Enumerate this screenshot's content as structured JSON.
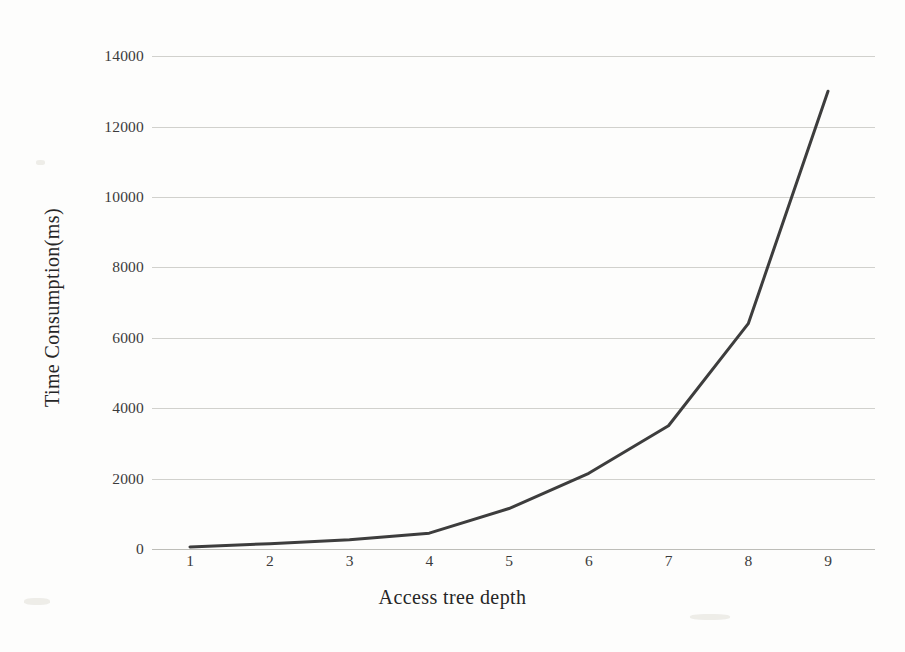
{
  "chart_data": {
    "type": "line",
    "title": "",
    "xlabel": "Access tree depth",
    "ylabel": "Time Consumption(ms)",
    "x": [
      1,
      2,
      3,
      4,
      5,
      6,
      7,
      8,
      9
    ],
    "categories": [
      "1",
      "2",
      "3",
      "4",
      "5",
      "6",
      "7",
      "8",
      "9"
    ],
    "values": [
      60,
      150,
      260,
      450,
      1150,
      2150,
      3500,
      6400,
      13000
    ],
    "series": [
      {
        "name": "Time Consumption(ms)",
        "values": [
          60,
          150,
          260,
          450,
          1150,
          2150,
          3500,
          6400,
          13000
        ]
      }
    ],
    "xtick_labels": [
      "1",
      "2",
      "3",
      "4",
      "5",
      "6",
      "7",
      "8",
      "9"
    ],
    "ytick_labels": [
      "0",
      "2000",
      "4000",
      "6000",
      "8000",
      "10000",
      "12000",
      "14000"
    ],
    "ytick_values": [
      0,
      2000,
      4000,
      6000,
      8000,
      10000,
      12000,
      14000
    ],
    "ylim": [
      0,
      14400
    ],
    "xlim": [
      1,
      9
    ],
    "grid": "horizontal",
    "legend": "none",
    "line_color": "#3d3d3d",
    "grid_color": "#c9c9c4",
    "background_color": "#fdfdfc",
    "text_color": "#262626"
  }
}
